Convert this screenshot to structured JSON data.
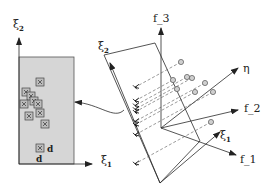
{
  "figure": {
    "left_panel": {
      "axis_y_label": "ξ",
      "axis_y_sub": "2",
      "axis_x_label": "ξ",
      "axis_x_sub": "1",
      "rect_fill": "#d6d6d6",
      "rect_stroke": "#555555",
      "marker_label_right": "d",
      "marker_label_below": "d",
      "markers": [
        {
          "x": 40,
          "y": 82
        },
        {
          "x": 26,
          "y": 92
        },
        {
          "x": 31,
          "y": 96
        },
        {
          "x": 34,
          "y": 101
        },
        {
          "x": 24,
          "y": 104
        },
        {
          "x": 38,
          "y": 104
        },
        {
          "x": 29,
          "y": 116
        },
        {
          "x": 40,
          "y": 113
        },
        {
          "x": 45,
          "y": 124
        },
        {
          "x": 40,
          "y": 148
        }
      ]
    },
    "right_panel": {
      "plane_label": "ξ",
      "plane_label_sub": "2",
      "plane_bottom_label": "ξ",
      "plane_bottom_sub": "1",
      "axes": [
        {
          "name": "f_3",
          "label": "f_3"
        },
        {
          "name": "eta",
          "label": "η"
        },
        {
          "name": "f_2",
          "label": "f_2"
        },
        {
          "name": "xi_1",
          "label": "ξ",
          "sub": "1"
        },
        {
          "name": "f_1",
          "label": "f_1"
        }
      ],
      "points_3d": [
        {
          "x": 181,
          "y": 62
        },
        {
          "x": 173,
          "y": 80
        },
        {
          "x": 187,
          "y": 77
        },
        {
          "x": 192,
          "y": 78
        },
        {
          "x": 205,
          "y": 83
        },
        {
          "x": 177,
          "y": 89
        },
        {
          "x": 195,
          "y": 92
        },
        {
          "x": 213,
          "y": 92
        },
        {
          "x": 211,
          "y": 122
        }
      ]
    },
    "connector": "curved arrow from plane to left panel"
  }
}
